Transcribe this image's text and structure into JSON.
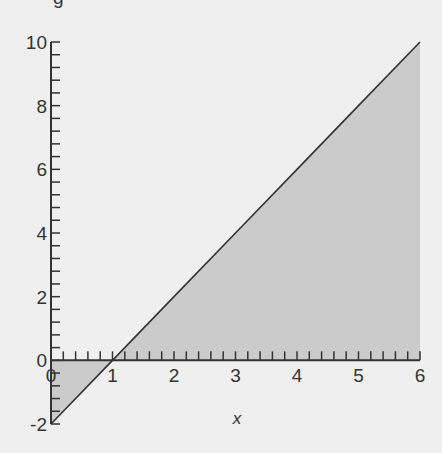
{
  "chart_data": {
    "type": "area",
    "title": "",
    "partial_text_top": "g",
    "xlabel": "x",
    "ylabel": "",
    "xlim": [
      0,
      6
    ],
    "ylim": [
      -2,
      10
    ],
    "x_ticks": [
      0,
      1,
      2,
      3,
      4,
      5,
      6
    ],
    "x_tick_labels": [
      "0",
      "1",
      "2",
      "3",
      "4",
      "5",
      "6"
    ],
    "x_minor_step": 0.2,
    "y_ticks": [
      -2,
      0,
      2,
      4,
      6,
      8,
      10
    ],
    "y_tick_labels": [
      "-2",
      "0",
      "2",
      "4",
      "6",
      "8",
      "10"
    ],
    "y_minor_step": 0.4,
    "grid": false,
    "legend": null,
    "series": [
      {
        "name": "y = 2x - 2",
        "x": [
          0,
          1,
          2,
          3,
          4,
          5,
          6
        ],
        "values": [
          -2,
          0,
          2,
          4,
          6,
          8,
          10
        ],
        "fill_to": 0,
        "line_color": "#333333",
        "fill_color": "#cbcbcb"
      }
    ]
  },
  "colors": {
    "background": "#efefef",
    "axis": "#333333",
    "fill": "#cbcbcb",
    "line": "#333333"
  }
}
